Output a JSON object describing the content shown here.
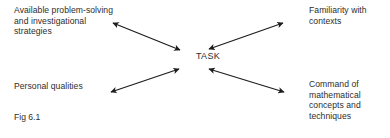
{
  "figure": {
    "caption": "Fig 6.1",
    "center_label": "TASK",
    "background_color": "#ffffff",
    "ink_color": "#2d2d2d",
    "nodes": [
      {
        "id": "top-left",
        "text": "Available problem-solving\nand investigational\nstrategies",
        "position": "top-left"
      },
      {
        "id": "top-right",
        "text": "Familiarity with\ncontexts",
        "position": "top-right"
      },
      {
        "id": "bottom-left",
        "text": "Personal qualities",
        "position": "bottom-left"
      },
      {
        "id": "bottom-right",
        "text": "Command of\nmathematical\nconcepts and\ntechniques",
        "position": "bottom-right"
      }
    ],
    "connectors": [
      {
        "id": "top-left-arrow",
        "from": "top-left",
        "to": "center",
        "style": "double-headed"
      },
      {
        "id": "top-right-arrow",
        "from": "top-right",
        "to": "center",
        "style": "double-headed"
      },
      {
        "id": "bottom-left-arrow",
        "from": "bottom-left",
        "to": "center",
        "style": "double-headed"
      },
      {
        "id": "bottom-right-arrow",
        "from": "bottom-right",
        "to": "center",
        "style": "double-headed"
      }
    ]
  }
}
